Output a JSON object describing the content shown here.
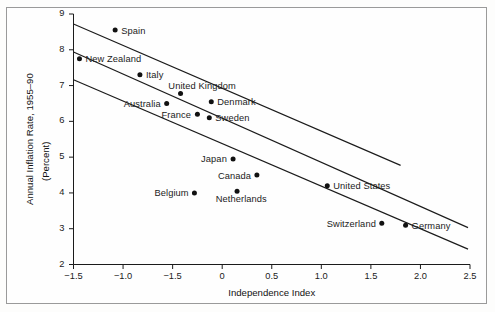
{
  "figure": {
    "border": true,
    "background": "#fefefe",
    "ink": "#1b1b1b"
  },
  "axes": {
    "x_title": "Independence Index",
    "y_title_line1": "Annual Inflation Rate, 1955–90",
    "y_title_line2": "(Percent)",
    "x_ticklabels": [
      "−1.5",
      "−1.0",
      "−1.5",
      "0",
      "0.5",
      "1.0",
      "1.5",
      "2.0",
      "2.5"
    ],
    "y_ticklabels": [
      "9",
      "8",
      "7",
      "6",
      "5",
      "4",
      "3",
      "2"
    ]
  },
  "chart_data": {
    "type": "scatter",
    "title": "",
    "xlabel": "Independence Index",
    "ylabel": "Annual Inflation Rate, 1955–90 (Percent)",
    "xlim": [
      -1.5,
      2.5
    ],
    "ylim": [
      2,
      9
    ],
    "xticks": [
      -1.5,
      -1.0,
      -0.5,
      0,
      0.5,
      1.0,
      1.5,
      2.0,
      2.5
    ],
    "xtick_labels_as_drawn": [
      "−1.5",
      "−1.0",
      "−1.5",
      "0",
      "0.5",
      "1.0",
      "1.5",
      "2.0",
      "2.5"
    ],
    "yticks": [
      2,
      3,
      4,
      5,
      6,
      7,
      8,
      9
    ],
    "grid": false,
    "legend": "none",
    "points": [
      {
        "label": "Spain",
        "x": -1.08,
        "y": 8.55,
        "label_side": "right"
      },
      {
        "label": "New Zealand",
        "x": -1.44,
        "y": 7.75,
        "label_side": "right"
      },
      {
        "label": "Italy",
        "x": -0.83,
        "y": 7.3,
        "label_side": "right"
      },
      {
        "label": "United Kingdom",
        "x": -0.42,
        "y": 6.78,
        "label_side": "above"
      },
      {
        "label": "Denmark",
        "x": -0.11,
        "y": 6.55,
        "label_side": "right"
      },
      {
        "label": "Australia",
        "x": -0.56,
        "y": 6.5,
        "label_side": "left"
      },
      {
        "label": "France",
        "x": -0.25,
        "y": 6.2,
        "label_side": "left"
      },
      {
        "label": "Sweden",
        "x": -0.13,
        "y": 6.1,
        "label_side": "right"
      },
      {
        "label": "Japan",
        "x": 0.11,
        "y": 4.95,
        "label_side": "left"
      },
      {
        "label": "Canada",
        "x": 0.35,
        "y": 4.5,
        "label_side": "left"
      },
      {
        "label": "Netherlands",
        "x": 0.15,
        "y": 4.05,
        "label_side": "below"
      },
      {
        "label": "Belgium",
        "x": -0.28,
        "y": 4.0,
        "label_side": "left"
      },
      {
        "label": "United States",
        "x": 1.06,
        "y": 4.2,
        "label_side": "right"
      },
      {
        "label": "Switzerland",
        "x": 1.61,
        "y": 3.15,
        "label_side": "left"
      },
      {
        "label": "Germany",
        "x": 1.85,
        "y": 3.1,
        "label_side": "right"
      }
    ],
    "lines": [
      {
        "name": "upper-band",
        "x0": -1.5,
        "y0": 8.72,
        "x1": 1.8,
        "y1": 4.77
      },
      {
        "name": "fit-line",
        "x0": -1.5,
        "y0": 7.94,
        "x1": 2.48,
        "y1": 3.03
      },
      {
        "name": "lower-band",
        "x0": -1.5,
        "y0": 7.16,
        "x1": 2.48,
        "y1": 2.43
      }
    ]
  }
}
